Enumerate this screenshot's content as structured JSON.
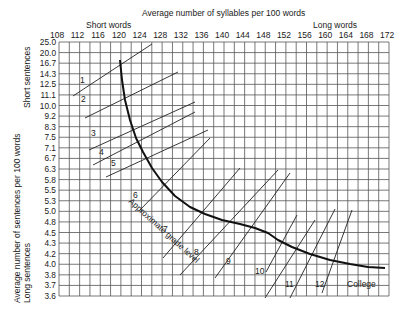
{
  "chart_data": {
    "type": "line",
    "xlabel": "Average number of syllables per 100 words",
    "ylabel": "Average number of sentences per 100 words",
    "x_annotations": {
      "left": "Short words",
      "right": "Long words"
    },
    "y_annotations": {
      "top": "Short sentences",
      "bottom": "Long sentences"
    },
    "x_ticks": [
      "108",
      "112",
      "116",
      "120",
      "124",
      "128",
      "132",
      "136",
      "140",
      "144",
      "148",
      "152",
      "156",
      "160",
      "164",
      "168",
      "172"
    ],
    "y_ticks": [
      "25.0",
      "20.0",
      "16.7",
      "14.3",
      "12.5",
      "11.1",
      "10.0",
      "9.2",
      "8.3",
      "7.5",
      "7.1",
      "6.7",
      "6.3",
      "5.8",
      "5.5",
      "5.3",
      "5.0",
      "4.8",
      "4.5",
      "4.3",
      "4.2",
      "4.0",
      "3.8",
      "3.7",
      "3.6"
    ],
    "xlim": [
      108,
      172
    ],
    "ylim": [
      3.6,
      25.0
    ],
    "grid": true,
    "series": [
      {
        "name": "Approximate grade level",
        "type": "curve",
        "points_px": [
          [
            120,
            60
          ],
          [
            122,
            80
          ],
          [
            125,
            100
          ],
          [
            130,
            120
          ],
          [
            136,
            138
          ],
          [
            143,
            152
          ],
          [
            152,
            168
          ],
          [
            162,
            182
          ],
          [
            175,
            196
          ],
          [
            190,
            207
          ],
          [
            205,
            214
          ],
          [
            222,
            220
          ],
          [
            240,
            224
          ],
          [
            255,
            228
          ],
          [
            268,
            233
          ],
          [
            278,
            240
          ],
          [
            292,
            247
          ],
          [
            310,
            254
          ],
          [
            330,
            260
          ],
          [
            350,
            264
          ],
          [
            368,
            267
          ],
          [
            385,
            268
          ]
        ]
      }
    ],
    "grade_bands": [
      {
        "label": "1",
        "line": [
          [
            73,
            96
          ],
          [
            152,
            44
          ]
        ],
        "label_pos": [
          80,
          83
        ]
      },
      {
        "label": "2",
        "line": [
          [
            85,
            118
          ],
          [
            178,
            72
          ]
        ],
        "label_pos": [
          81,
          102
        ]
      },
      {
        "label": "3",
        "line": [
          [
            89,
            150
          ],
          [
            195,
            102
          ]
        ],
        "label_pos": [
          91,
          136
        ]
      },
      {
        "label": "4",
        "line": [
          [
            93,
            165
          ],
          [
            195,
            112
          ]
        ],
        "label_pos": [
          99,
          155
        ]
      },
      {
        "label": "5",
        "line": [
          [
            106,
            177
          ],
          [
            208,
            130
          ]
        ],
        "label_pos": [
          111,
          166
        ]
      },
      {
        "label": "6",
        "line": [
          [
            140,
            210
          ],
          [
            210,
            138
          ]
        ],
        "label_pos": [
          133,
          198
        ]
      },
      {
        "label": "7",
        "line": [
          [
            163,
            258
          ],
          [
            240,
            168
          ]
        ],
        "label_pos": [
          163,
          232
        ]
      },
      {
        "label": "8",
        "line": [
          [
            180,
            275
          ],
          [
            278,
            170
          ]
        ],
        "label_pos": [
          194,
          255
        ]
      },
      {
        "label": "9",
        "line": [
          [
            215,
            278
          ],
          [
            290,
            173
          ]
        ],
        "label_pos": [
          226,
          264
        ]
      },
      {
        "label": "10",
        "line": [
          [
            266,
            272
          ],
          [
            297,
            215
          ]
        ],
        "label_pos": [
          255,
          274
        ]
      },
      {
        "label": "11",
        "line": [
          [
            265,
            298
          ],
          [
            315,
            220
          ]
        ],
        "label_pos": [
          285,
          287
        ]
      },
      {
        "label": "12",
        "line": [
          [
            290,
            298
          ],
          [
            335,
            209
          ]
        ],
        "label_pos": [
          315,
          287
        ]
      },
      {
        "label": "College",
        "line": [
          [
            322,
            293
          ],
          [
            352,
            210
          ]
        ],
        "label_pos": [
          347,
          287
        ]
      }
    ],
    "curve_label": "Approximate grade level"
  },
  "labels": {
    "x_title": "Average number of syllables per 100 words",
    "short_words": "Short words",
    "long_words": "Long words",
    "short_sentences": "Short sentences",
    "long_sentences": "Long sentences",
    "y_title": "Average number of sentences per 100 words",
    "curve_label": "Approximate grade level"
  }
}
